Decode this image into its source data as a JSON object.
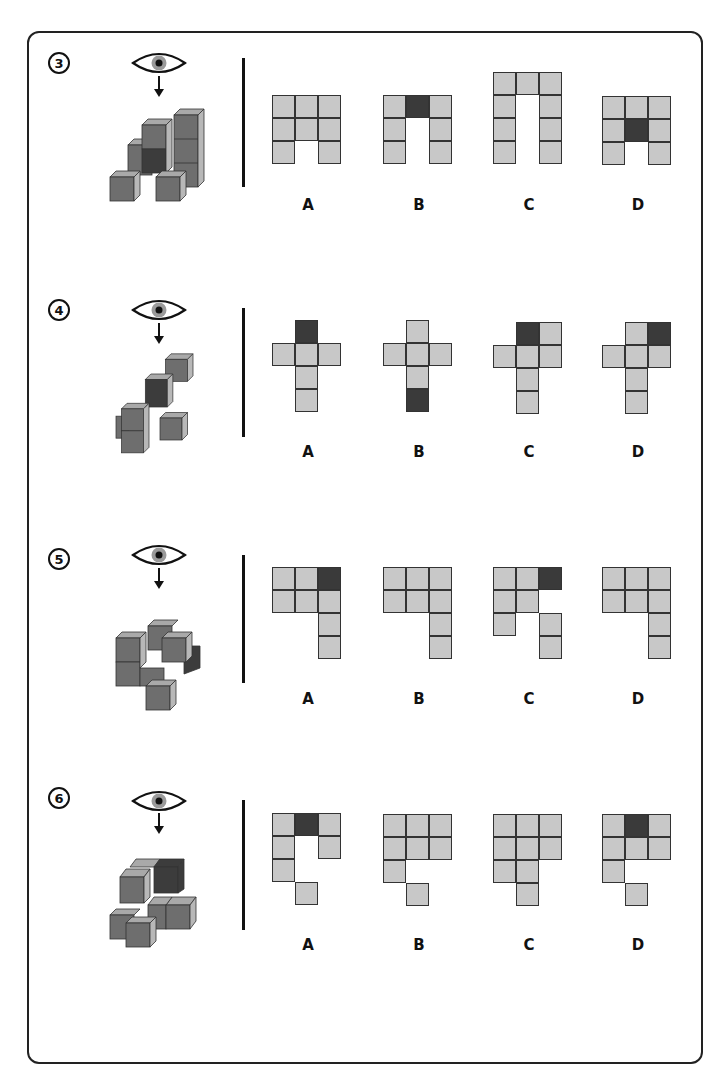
{
  "puzzles": [
    {
      "number": "3",
      "options": [
        {
          "label": "A",
          "cells": [
            [
              0,
              0,
              0
            ],
            [
              1,
              0,
              0
            ],
            [
              2,
              0,
              0
            ],
            [
              0,
              1,
              0
            ],
            [
              1,
              1,
              0
            ],
            [
              2,
              1,
              0
            ],
            [
              0,
              2,
              0
            ],
            [
              2,
              2,
              0
            ]
          ]
        },
        {
          "label": "B",
          "cells": [
            [
              0,
              0,
              0
            ],
            [
              1,
              0,
              1
            ],
            [
              2,
              0,
              0
            ],
            [
              0,
              1,
              0
            ],
            [
              2,
              1,
              0
            ],
            [
              0,
              2,
              0
            ],
            [
              2,
              2,
              0
            ]
          ]
        },
        {
          "label": "C",
          "cells": [
            [
              0,
              0,
              0
            ],
            [
              1,
              0,
              0
            ],
            [
              2,
              0,
              0
            ],
            [
              0,
              1,
              0
            ],
            [
              2,
              1,
              0
            ],
            [
              0,
              2,
              0
            ],
            [
              2,
              2,
              0
            ],
            [
              0,
              3,
              0
            ],
            [
              2,
              3,
              0
            ]
          ]
        },
        {
          "label": "D",
          "cells": [
            [
              0,
              0,
              0
            ],
            [
              1,
              0,
              0
            ],
            [
              2,
              0,
              0
            ],
            [
              0,
              1,
              0
            ],
            [
              1,
              1,
              1
            ],
            [
              2,
              1,
              0
            ],
            [
              0,
              2,
              0
            ],
            [
              2,
              2,
              0
            ]
          ]
        }
      ]
    },
    {
      "number": "4",
      "options": [
        {
          "label": "A",
          "cells": [
            [
              1,
              0,
              1
            ],
            [
              0,
              1,
              0
            ],
            [
              1,
              1,
              0
            ],
            [
              2,
              1,
              0
            ],
            [
              1,
              2,
              0
            ],
            [
              1,
              3,
              0
            ]
          ]
        },
        {
          "label": "B",
          "cells": [
            [
              1,
              0,
              0
            ],
            [
              0,
              1,
              0
            ],
            [
              1,
              1,
              0
            ],
            [
              2,
              1,
              0
            ],
            [
              1,
              2,
              0
            ],
            [
              1,
              3,
              1
            ]
          ]
        },
        {
          "label": "C",
          "cells": [
            [
              1,
              0,
              1
            ],
            [
              2,
              0,
              0
            ],
            [
              0,
              1,
              0
            ],
            [
              1,
              1,
              0
            ],
            [
              2,
              1,
              0
            ],
            [
              1,
              2,
              0
            ],
            [
              1,
              3,
              0
            ]
          ]
        },
        {
          "label": "D",
          "cells": [
            [
              1,
              0,
              0
            ],
            [
              2,
              0,
              1
            ],
            [
              0,
              1,
              0
            ],
            [
              1,
              1,
              0
            ],
            [
              2,
              1,
              0
            ],
            [
              1,
              2,
              0
            ],
            [
              1,
              3,
              0
            ]
          ]
        }
      ]
    },
    {
      "number": "5",
      "options": [
        {
          "label": "A",
          "cells": [
            [
              0,
              0,
              0
            ],
            [
              1,
              0,
              0
            ],
            [
              2,
              0,
              1
            ],
            [
              0,
              1,
              0
            ],
            [
              1,
              1,
              0
            ],
            [
              2,
              1,
              0
            ],
            [
              2,
              2,
              0
            ],
            [
              2,
              3,
              0
            ]
          ]
        },
        {
          "label": "B",
          "cells": [
            [
              0,
              0,
              0
            ],
            [
              1,
              0,
              0
            ],
            [
              2,
              0,
              0
            ],
            [
              0,
              1,
              0
            ],
            [
              1,
              1,
              0
            ],
            [
              2,
              1,
              0
            ],
            [
              2,
              2,
              0
            ],
            [
              2,
              3,
              0
            ]
          ]
        },
        {
          "label": "C",
          "cells": [
            [
              0,
              0,
              0
            ],
            [
              1,
              0,
              0
            ],
            [
              2,
              0,
              1
            ],
            [
              0,
              1,
              0
            ],
            [
              1,
              1,
              0
            ],
            [
              0,
              2,
              0
            ],
            [
              2,
              2,
              0
            ],
            [
              2,
              3,
              0
            ]
          ]
        },
        {
          "label": "D",
          "cells": [
            [
              0,
              0,
              0
            ],
            [
              1,
              0,
              0
            ],
            [
              2,
              0,
              0
            ],
            [
              0,
              1,
              0
            ],
            [
              1,
              1,
              0
            ],
            [
              2,
              1,
              0
            ],
            [
              2,
              2,
              0
            ],
            [
              2,
              3,
              0
            ]
          ]
        }
      ]
    },
    {
      "number": "6",
      "options": [
        {
          "label": "A",
          "cells": [
            [
              0,
              0,
              0
            ],
            [
              1,
              0,
              1
            ],
            [
              2,
              0,
              0
            ],
            [
              0,
              1,
              0
            ],
            [
              2,
              1,
              0
            ],
            [
              0,
              2,
              0
            ],
            [
              1,
              3,
              0
            ]
          ]
        },
        {
          "label": "B",
          "cells": [
            [
              0,
              0,
              0
            ],
            [
              1,
              0,
              0
            ],
            [
              2,
              0,
              0
            ],
            [
              0,
              1,
              0
            ],
            [
              1,
              1,
              0
            ],
            [
              2,
              1,
              0
            ],
            [
              0,
              2,
              0
            ],
            [
              1,
              3,
              0
            ]
          ]
        },
        {
          "label": "C",
          "cells": [
            [
              0,
              0,
              0
            ],
            [
              1,
              0,
              0
            ],
            [
              2,
              0,
              0
            ],
            [
              0,
              1,
              0
            ],
            [
              1,
              1,
              0
            ],
            [
              2,
              1,
              0
            ],
            [
              0,
              2,
              0
            ],
            [
              1,
              2,
              0
            ],
            [
              1,
              3,
              0
            ]
          ]
        },
        {
          "label": "D",
          "cells": [
            [
              0,
              0,
              0
            ],
            [
              1,
              0,
              1
            ],
            [
              2,
              0,
              0
            ],
            [
              0,
              1,
              0
            ],
            [
              1,
              1,
              0
            ],
            [
              2,
              1,
              0
            ],
            [
              0,
              2,
              0
            ],
            [
              1,
              3,
              0
            ]
          ]
        }
      ]
    }
  ],
  "colors": {
    "face_light": "#c8c8c8",
    "face_dark": "#3a3a3a",
    "cube_front": "#6e6e6e",
    "cube_top": "#a9a9a9",
    "cube_side": "#b8b8b8",
    "cube_highlight": "#3c3c3c"
  }
}
